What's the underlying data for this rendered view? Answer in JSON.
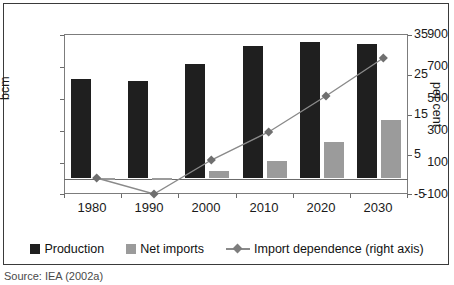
{
  "chart_data": {
    "type": "bar",
    "title": "",
    "xlabel": "",
    "ylabel": "bcm",
    "y2label": "per cent",
    "categories": [
      "1980",
      "1990",
      "2000",
      "2010",
      "2020",
      "2030"
    ],
    "ylim": [
      -100,
      900
    ],
    "yticks": [
      "900",
      "700",
      "500",
      "300",
      "100",
      "-100"
    ],
    "y2lim": [
      -5,
      35
    ],
    "y2ticks": [
      "35",
      "25",
      "15",
      "5",
      "-5"
    ],
    "grid": false,
    "legend_position": "bottom",
    "series": [
      {
        "name": "Production",
        "type": "bar",
        "axis": "left",
        "color": "#1f1f1f",
        "values": [
          620,
          605,
          715,
          825,
          850,
          840
        ]
      },
      {
        "name": "Net imports",
        "type": "bar",
        "axis": "left",
        "color": "#9b9b9b",
        "values": [
          0,
          -12,
          45,
          105,
          225,
          360
        ]
      },
      {
        "name": "Import dependence (right axis)",
        "type": "line",
        "axis": "right",
        "color": "#8a8a8a",
        "values": [
          0,
          -4,
          4.5,
          11.5,
          20.5,
          30
        ]
      }
    ]
  },
  "axes": {
    "left_title": "bcm",
    "right_title": "per cent",
    "left_ticks": [
      "900",
      "700",
      "500",
      "300",
      "100",
      "-100"
    ],
    "right_ticks": [
      "35",
      "25",
      "15",
      "5",
      "-5"
    ],
    "x_ticks": [
      "1980",
      "1990",
      "2000",
      "2010",
      "2020",
      "2030"
    ]
  },
  "legend": {
    "items": [
      {
        "label": "Production",
        "marker": "square-dark"
      },
      {
        "label": "Net imports",
        "marker": "square-grey"
      },
      {
        "label": "Import dependence (right axis)",
        "marker": "line-diamond"
      }
    ]
  },
  "source": {
    "text": "Source: IEA (2002a)"
  }
}
